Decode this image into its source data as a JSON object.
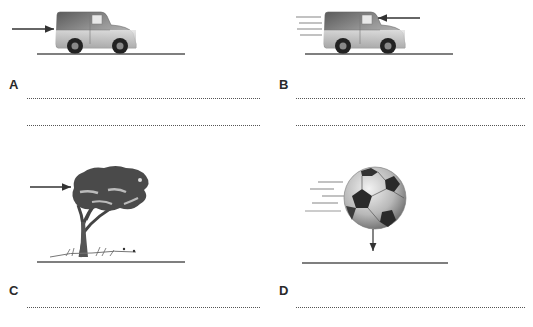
{
  "worksheet": {
    "panels": [
      {
        "id": "A",
        "label": "A",
        "image": "van-icon",
        "description": "Stationary van with a force arrow pushing from behind",
        "force_arrow": "pointing right, applied to rear of van",
        "motion_lines": false,
        "answer_lines": 2
      },
      {
        "id": "B",
        "label": "B",
        "image": "van-icon",
        "description": "Moving van with motion lines and a force arrow acting against the front",
        "force_arrow": "pointing left, applied to front of van",
        "motion_lines": true,
        "answer_lines": 2
      },
      {
        "id": "C",
        "label": "C",
        "image": "tree-icon",
        "description": "Tree bending with a force arrow from the left (wind)",
        "force_arrow": "pointing right, applied to tree canopy",
        "motion_lines": false,
        "answer_lines": 1
      },
      {
        "id": "D",
        "label": "D",
        "image": "football-icon",
        "description": "Football moving with motion lines and a downward force arrow",
        "force_arrow": "pointing down, below ball",
        "motion_lines": true,
        "answer_lines": 1
      }
    ],
    "colors": {
      "arrow": "#333333",
      "ground": "#555555",
      "van_body": "#8a8a8a",
      "tree_canopy": "#4a4a4a",
      "dotted_line": "#555555"
    }
  }
}
